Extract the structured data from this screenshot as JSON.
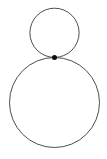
{
  "document": {
    "title": "Tangent Circles Diagram",
    "background_color": "#ffffff",
    "width": 107,
    "height": 159
  },
  "figure": {
    "kind": "geometric-diagram",
    "stroke_color": "#3a3a3a",
    "stroke_width": 0.9,
    "vertex_color": "#0d0d0d",
    "shapes": [
      {
        "name": "small-circle",
        "type": "circle",
        "cx": 54.5,
        "cy": 32.8,
        "r": 24.6,
        "fill": "none"
      },
      {
        "name": "large-circle",
        "type": "circle",
        "cx": 54.5,
        "cy": 102.5,
        "r": 45.0,
        "fill": "none"
      }
    ],
    "vertex": {
      "name": "tangency-point",
      "type": "point",
      "cx": 54.5,
      "cy": 57.5,
      "r": 2.5,
      "fill": "#0d0d0d"
    }
  }
}
